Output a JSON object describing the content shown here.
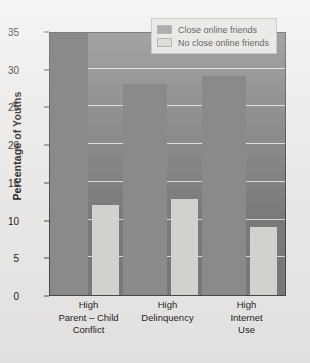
{
  "chart_data": {
    "type": "bar",
    "title": "",
    "xlabel": "",
    "ylabel": "Percentage of Youths",
    "ylim": [
      0,
      35
    ],
    "yticks": [
      0,
      5,
      10,
      15,
      20,
      25,
      30,
      35
    ],
    "ytick_labels": [
      "0",
      "5",
      "10",
      "15",
      "20",
      "25",
      "30",
      "35"
    ],
    "grid": true,
    "legend_position": "top-right",
    "categories": [
      "High\nParent – Child\nConflict",
      "High\nDelinquency",
      "High\nInternet\nUse"
    ],
    "category_lines": [
      [
        "High",
        "Parent – Child",
        "Conflict"
      ],
      [
        "High",
        "Delinquency"
      ],
      [
        "High",
        "Internet",
        "Use"
      ]
    ],
    "series": [
      {
        "name": "Close online friends",
        "color": "#8a8a8a",
        "values": [
          35,
          28,
          29
        ]
      },
      {
        "name": "No close online friends",
        "color": "#d2d2cd",
        "values": [
          12,
          12.7,
          9
        ]
      }
    ]
  },
  "legend": {
    "items": [
      {
        "label": "Close online friends",
        "color": "#8a8a8a"
      },
      {
        "label": "No close online friends",
        "color": "#d2d2cd"
      }
    ]
  },
  "axis": {
    "y_title": "Percentage of Youths"
  },
  "colors": {
    "plot_background": "#7d7d7d",
    "figure_background": "#efeeec",
    "gridline": "#efefe9",
    "axis_line": "#4a4a4a",
    "text": "#231f1e",
    "series_dark": "#8a8a8a",
    "series_light": "#d2d2cd",
    "legend_background": "#e3e2de"
  }
}
